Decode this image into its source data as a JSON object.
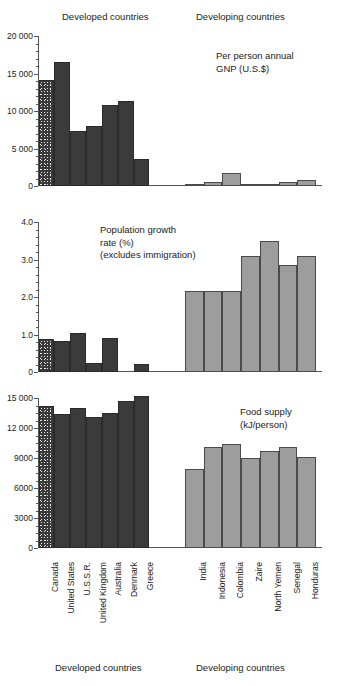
{
  "headers": {
    "developed": "Developed countries",
    "developing": "Developing countries"
  },
  "footers": {
    "developed": "Developed countries",
    "developing": "Developing countries"
  },
  "countries": {
    "developed": [
      "Canada",
      "United States",
      "U.S.S.R.",
      "United Kingdom",
      "Australia",
      "Denmark",
      "Greece"
    ],
    "developing": [
      "India",
      "Indonesia",
      "Colombia",
      "Zaire",
      "North Yemen",
      "Senegal",
      "Honduras"
    ]
  },
  "colors": {
    "developed_bar": "#3b3b3b",
    "developing_bar": "#9d9d9d",
    "canada_bar": "#3a3a3a",
    "axis": "#555555",
    "text": "#1a1a1a"
  },
  "chart_data": [
    {
      "type": "bar",
      "title": "Per person annual GNP (U.S.$)",
      "title_lines": [
        "Per person annual",
        "GNP (U.S.$)"
      ],
      "xlabel": "",
      "ylabel": "",
      "ylim": [
        0,
        20000
      ],
      "yticks": [
        0,
        5000,
        10000,
        15000,
        20000
      ],
      "ytick_labels": [
        "0",
        "5 000",
        "10 000",
        "15 000",
        "20 000"
      ],
      "minor_tick_step": 1000,
      "grid": false,
      "legend": "none",
      "categories": [
        "Canada",
        "United States",
        "U.S.S.R.",
        "United Kingdom",
        "Australia",
        "Denmark",
        "Greece",
        "India",
        "Indonesia",
        "Colombia",
        "Zaire",
        "North Yemen",
        "Senegal",
        "Honduras"
      ],
      "values": [
        14100,
        16600,
        7350,
        8050,
        10800,
        11350,
        3650,
        290,
        560,
        1700,
        330,
        250,
        510,
        830
      ],
      "series": [
        {
          "name": "Developed countries",
          "categories": [
            "Canada",
            "United States",
            "U.S.S.R.",
            "United Kingdom",
            "Australia",
            "Denmark",
            "Greece"
          ],
          "values": [
            14100,
            16600,
            7350,
            8050,
            10800,
            11350,
            3650
          ]
        },
        {
          "name": "Developing countries",
          "categories": [
            "India",
            "Indonesia",
            "Colombia",
            "Zaire",
            "North Yemen",
            "Senegal",
            "Honduras"
          ],
          "values": [
            290,
            560,
            1700,
            330,
            250,
            510,
            830
          ]
        }
      ]
    },
    {
      "type": "bar",
      "title": "Population growth rate (%) (excludes immigration)",
      "title_lines": [
        "Population growth",
        "rate (%)",
        "(excludes immigration)"
      ],
      "xlabel": "",
      "ylabel": "",
      "ylim": [
        0,
        4.0
      ],
      "yticks": [
        0,
        1.0,
        2.0,
        3.0,
        4.0
      ],
      "ytick_labels": [
        "0",
        "1.0",
        "2.0",
        "3.0",
        "4.0"
      ],
      "minor_tick_step": 0.2,
      "grid": false,
      "legend": "none",
      "categories": [
        "Canada",
        "United States",
        "U.S.S.R.",
        "United Kingdom",
        "Australia",
        "Denmark",
        "Greece",
        "India",
        "Indonesia",
        "Colombia",
        "Zaire",
        "North Yemen",
        "Senegal",
        "Honduras"
      ],
      "values": [
        0.88,
        0.82,
        1.04,
        0.25,
        0.92,
        0.0,
        0.22,
        2.15,
        2.15,
        2.15,
        3.1,
        3.5,
        2.85,
        3.1
      ],
      "series": [
        {
          "name": "Developed countries",
          "categories": [
            "Canada",
            "United States",
            "U.S.S.R.",
            "United Kingdom",
            "Australia",
            "Denmark",
            "Greece"
          ],
          "values": [
            0.88,
            0.82,
            1.04,
            0.25,
            0.92,
            0.0,
            0.22
          ]
        },
        {
          "name": "Developing countries",
          "categories": [
            "India",
            "Indonesia",
            "Colombia",
            "Zaire",
            "North Yemen",
            "Senegal",
            "Honduras"
          ],
          "values": [
            2.15,
            2.15,
            2.15,
            3.1,
            3.5,
            2.85,
            3.1
          ]
        }
      ]
    },
    {
      "type": "bar",
      "title": "Food supply (kJ/person)",
      "title_lines": [
        "Food supply",
        "(kJ/person)"
      ],
      "xlabel": "",
      "ylabel": "",
      "ylim": [
        0,
        15000
      ],
      "yticks": [
        0,
        3000,
        6000,
        9000,
        12000,
        15000
      ],
      "ytick_labels": [
        "0",
        "3000",
        "6000",
        "9000",
        "12 000",
        "15 000"
      ],
      "minor_tick_step": 750,
      "grid": false,
      "legend": "none",
      "categories": [
        "Canada",
        "United States",
        "U.S.S.R.",
        "United Kingdom",
        "Australia",
        "Denmark",
        "Greece",
        "India",
        "Indonesia",
        "Colombia",
        "Zaire",
        "North Yemen",
        "Senegal",
        "Honduras"
      ],
      "values": [
        14200,
        13400,
        14000,
        13100,
        13500,
        14700,
        15200,
        7900,
        10100,
        10400,
        9000,
        9700,
        10100,
        9150
      ],
      "series": [
        {
          "name": "Developed countries",
          "categories": [
            "Canada",
            "United States",
            "U.S.S.R.",
            "United Kingdom",
            "Australia",
            "Denmark",
            "Greece"
          ],
          "values": [
            14200,
            13400,
            14000,
            13100,
            13500,
            14700,
            15200
          ]
        },
        {
          "name": "Developing countries",
          "categories": [
            "India",
            "Indonesia",
            "Colombia",
            "Zaire",
            "North Yemen",
            "Senegal",
            "Honduras"
          ],
          "values": [
            7900,
            10100,
            10400,
            9000,
            9700,
            10100,
            9150
          ]
        }
      ]
    }
  ]
}
